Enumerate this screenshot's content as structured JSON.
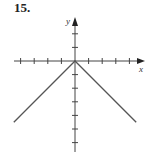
{
  "problem_number": "15.",
  "chart_data": {
    "type": "line",
    "title": "",
    "xlabel": "x",
    "ylabel": "y",
    "function": "y = -|x|",
    "x_ticks": [
      -4,
      -3,
      -2,
      -1,
      1,
      2,
      3,
      4
    ],
    "y_ticks": [
      2,
      1,
      -1,
      -2,
      -3,
      -4,
      -5,
      -6
    ],
    "xlim": [
      -4.5,
      5
    ],
    "ylim": [
      -6.8,
      3.2
    ],
    "grid": false,
    "series": [
      {
        "name": "y = -|x|",
        "x": [
          -4.5,
          0,
          4.5
        ],
        "y": [
          -4.5,
          0,
          -4.5
        ],
        "color": "#555555"
      }
    ]
  }
}
